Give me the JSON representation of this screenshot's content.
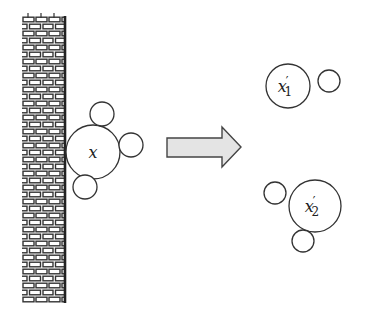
{
  "diagram": {
    "wall": {
      "label": "brick wall"
    },
    "before": {
      "molecule_label": "x"
    },
    "arrow": {
      "fill": "#e4e4e4",
      "stroke": "#444444"
    },
    "after": {
      "fragment_1": {
        "label": "x",
        "prime": "′",
        "subscript": "1"
      },
      "fragment_2": {
        "label": "x",
        "prime": "′",
        "subscript": "2"
      }
    },
    "colors": {
      "stroke": "#333333",
      "background": "#ffffff"
    }
  }
}
